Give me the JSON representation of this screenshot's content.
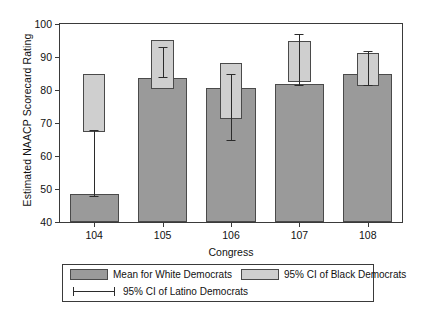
{
  "chart_data": {
    "type": "bar",
    "title": "",
    "xlabel": "Congress",
    "ylabel": "Estimated NAACP Scorecard Rating",
    "categories": [
      "104",
      "105",
      "106",
      "107",
      "108"
    ],
    "ylim": [
      40,
      100
    ],
    "yticks": [
      40,
      50,
      60,
      70,
      80,
      90,
      100
    ],
    "grid": false,
    "legend_position": "bottom",
    "series": [
      {
        "name": "Mean for White Democrats",
        "kind": "bar",
        "color": "#9a9a9a",
        "values": [
          48.5,
          83.7,
          80.5,
          81.8,
          85.0
        ]
      },
      {
        "name": "95% CI of Black Democrats",
        "kind": "ci-box",
        "color": "#cfcfcf",
        "lower": [
          67.3,
          80.2,
          71.3,
          82.5,
          81.2
        ],
        "upper": [
          84.8,
          95.2,
          88.3,
          94.7,
          91.2
        ]
      },
      {
        "name": "95% CI of Latino Democrats",
        "kind": "error-bar",
        "color": "#2b2b2b",
        "lower": [
          48.0,
          84.0,
          65.0,
          81.5,
          81.5
        ],
        "upper": [
          68.0,
          93.0,
          85.0,
          97.0,
          91.8
        ]
      }
    ]
  },
  "legend": {
    "items": [
      {
        "label": "Mean for White Democrats",
        "marker": "filled-dark-swatch"
      },
      {
        "label": "95% CI of Black Democrats",
        "marker": "filled-light-swatch"
      },
      {
        "label": "95% CI of Latino Democrats",
        "marker": "error-bar-marker"
      }
    ]
  }
}
